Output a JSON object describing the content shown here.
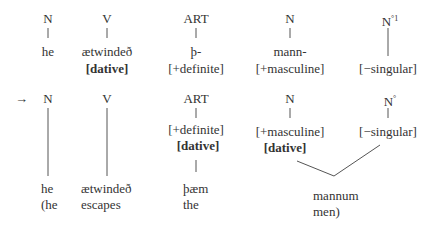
{
  "row1": {
    "labels": [
      "N",
      "V",
      "ART",
      "N",
      "N",
      "°1"
    ],
    "words": [
      "he",
      "ætwindeð",
      "þ-",
      "mann-"
    ],
    "features": [
      "[dative]",
      "[+definite]",
      "[+masculine]",
      "[−singular]"
    ]
  },
  "row2": {
    "arrow": "→",
    "labels": [
      "N",
      "V",
      "ART",
      "N",
      "N",
      "°"
    ],
    "features": {
      "art_definite": "[+definite]",
      "art_dative": "[dative]",
      "n_masculine": "[+masculine]",
      "n_dative": "[dative]",
      "no_singular": "[−singular]"
    },
    "words": [
      "he",
      "ætwindeð",
      "þæm",
      "mannum"
    ],
    "gloss": [
      "(he",
      "escapes",
      "the",
      "men)"
    ]
  }
}
